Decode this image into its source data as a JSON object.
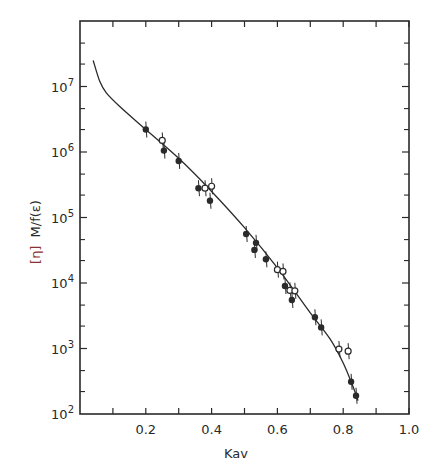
{
  "chart_data": {
    "type": "scatter",
    "title": "",
    "xlabel": "Kav",
    "ylabel": "[η] M/f(ε)",
    "ylabel_parts": {
      "bracket": "[η]",
      "rest": "M/f(ε)"
    },
    "xlim": [
      0.0,
      1.0
    ],
    "ylim": [
      100,
      100000000
    ],
    "yscale": "log",
    "grid": false,
    "legend": null,
    "x_ticks": [
      {
        "value": 0.2,
        "label": "0.2"
      },
      {
        "value": 0.4,
        "label": "0.4"
      },
      {
        "value": 0.6,
        "label": "0.6"
      },
      {
        "value": 0.8,
        "label": "0.8"
      },
      {
        "value": 1.0,
        "label": "1.0"
      }
    ],
    "x_minor_ticks": [
      0.1,
      0.3,
      0.5,
      0.7,
      0.9
    ],
    "y_ticks": [
      {
        "value": 100,
        "base": "10",
        "exp": "2"
      },
      {
        "value": 1000,
        "base": "10",
        "exp": "3"
      },
      {
        "value": 10000,
        "base": "10",
        "exp": "4"
      },
      {
        "value": 100000,
        "base": "10",
        "exp": "5"
      },
      {
        "value": 1000000,
        "base": "10",
        "exp": "6"
      },
      {
        "value": 10000000,
        "base": "10",
        "exp": "7"
      }
    ],
    "series": [
      {
        "name": "filled circles",
        "marker": "filled-circle",
        "points": [
          {
            "x": 0.2,
            "y": 2200000
          },
          {
            "x": 0.255,
            "y": 1050000
          },
          {
            "x": 0.3,
            "y": 730000
          },
          {
            "x": 0.36,
            "y": 280000
          },
          {
            "x": 0.395,
            "y": 180000
          },
          {
            "x": 0.505,
            "y": 56000
          },
          {
            "x": 0.535,
            "y": 41000
          },
          {
            "x": 0.53,
            "y": 32000
          },
          {
            "x": 0.565,
            "y": 23000
          },
          {
            "x": 0.623,
            "y": 9000
          },
          {
            "x": 0.644,
            "y": 5500
          },
          {
            "x": 0.714,
            "y": 3000
          },
          {
            "x": 0.733,
            "y": 2100
          },
          {
            "x": 0.824,
            "y": 310
          },
          {
            "x": 0.839,
            "y": 190
          }
        ]
      },
      {
        "name": "open circles",
        "marker": "open-circle",
        "points": [
          {
            "x": 0.25,
            "y": 1500000
          },
          {
            "x": 0.38,
            "y": 280000
          },
          {
            "x": 0.4,
            "y": 300000
          },
          {
            "x": 0.6,
            "y": 16000
          },
          {
            "x": 0.617,
            "y": 15000
          },
          {
            "x": 0.638,
            "y": 7700
          },
          {
            "x": 0.653,
            "y": 7600
          },
          {
            "x": 0.787,
            "y": 980
          },
          {
            "x": 0.815,
            "y": 910
          }
        ]
      },
      {
        "name": "fitted curve",
        "marker": "line",
        "points": [
          {
            "x": 0.04,
            "y": 25000000
          },
          {
            "x": 0.06,
            "y": 12000000
          },
          {
            "x": 0.08,
            "y": 8000000
          },
          {
            "x": 0.12,
            "y": 5000000
          },
          {
            "x": 0.2,
            "y": 2200000
          },
          {
            "x": 0.3,
            "y": 800000
          },
          {
            "x": 0.4,
            "y": 250000
          },
          {
            "x": 0.5,
            "y": 70000
          },
          {
            "x": 0.6,
            "y": 17000
          },
          {
            "x": 0.7,
            "y": 3500
          },
          {
            "x": 0.76,
            "y": 1400
          },
          {
            "x": 0.8,
            "y": 600
          },
          {
            "x": 0.83,
            "y": 260
          },
          {
            "x": 0.845,
            "y": 160
          }
        ]
      }
    ],
    "colors": {
      "ink": "#2a2a2a",
      "ylabel_bracket": "#8a3030",
      "background": "#ffffff"
    }
  }
}
